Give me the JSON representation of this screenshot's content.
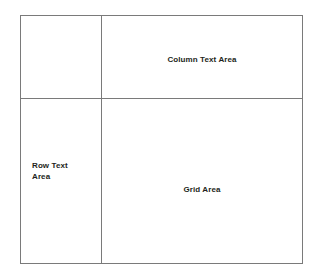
{
  "diagram": {
    "type": "grid-layout-schematic",
    "border_color": "#7a7a7a",
    "text_color": "#231f20",
    "background_color": "#ffffff",
    "cells": {
      "corner": {
        "name": "corner-cell",
        "label": ""
      },
      "column_header": {
        "name": "column-text-area-cell",
        "label": "Column Text Area"
      },
      "row_header": {
        "name": "row-text-area-cell",
        "label": "Row Text\nArea"
      },
      "grid_body": {
        "name": "grid-area-cell",
        "label": "Grid Area"
      }
    }
  }
}
